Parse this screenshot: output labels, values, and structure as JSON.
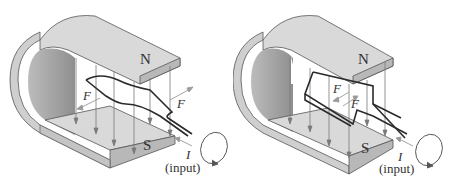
{
  "figures": [
    {
      "id": "left",
      "description": "Horseshoe magnet with single-loop coil lying nearly flat in field",
      "labels": {
        "north": "N",
        "south": "S",
        "force_left": "F",
        "force_right": "F",
        "current": "I",
        "input": "(input)"
      }
    },
    {
      "id": "right",
      "description": "Horseshoe magnet with coil rotated perpendicular to field",
      "labels": {
        "north": "N",
        "south": "S",
        "force_upper": "F",
        "force_lower": "F",
        "current": "I",
        "input": "(input)"
      }
    }
  ],
  "colors": {
    "magnet_face": "#d9d9d9",
    "magnet_edge": "#b8b8b8",
    "magnet_inner": "#a9a9a9",
    "outline": "#555555",
    "field_lines": "#7a7a7a",
    "wire": "#2a2a2a",
    "force_arrow": "#9a9a9a"
  }
}
